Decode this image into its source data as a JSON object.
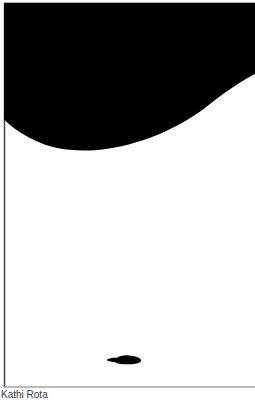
{
  "artwork": {
    "colors": {
      "background": "#ffffff",
      "ink": "#000000",
      "frame": "#444444",
      "caption": "#3a3a3a"
    },
    "shapes": [
      {
        "name": "black-curved-mass",
        "description": "large black shape filling top of frame with a sweeping curved lower edge"
      },
      {
        "name": "small-black-blob",
        "description": "small black irregular blot near bottom center"
      }
    ]
  },
  "caption": {
    "artist": "Kathi Rota"
  }
}
